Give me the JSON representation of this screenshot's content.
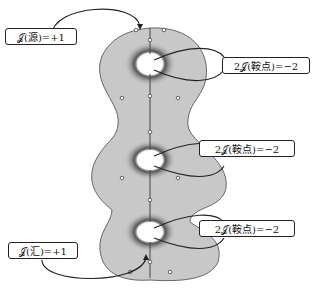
{
  "labels": {
    "source": "𝒥(源)=+1",
    "saddle_top": "2𝒥(鞍点)=−2",
    "saddle_mid": "2𝒥(鞍点)=−2",
    "saddle_bottom": "2𝒥(鞍点)=−2",
    "sink": "𝒥(汇)=+1"
  },
  "colors": {
    "surface": "#c8c8c8",
    "outline": "#555555",
    "stroke": "#222222"
  }
}
